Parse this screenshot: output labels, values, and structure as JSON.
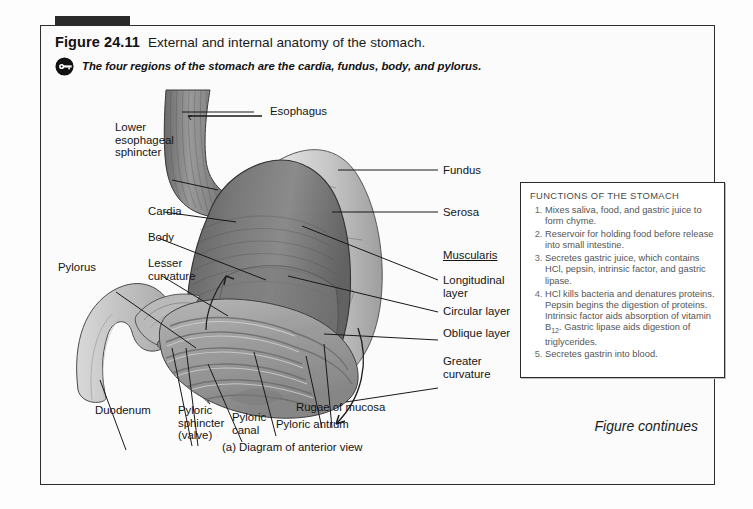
{
  "figure": {
    "number": "Figure 24.11",
    "title": "External and internal anatomy of the stomach.",
    "key_icon": "key-icon",
    "key_point": "The four regions of the stomach are the cardia, fundus, body, and pylorus.",
    "caption": "(a) Diagram of anterior view",
    "continues": "Figure continues"
  },
  "labels": {
    "esophagus": "Esophagus",
    "lower_esophageal_sphincter": "Lower\nesophageal\nsphincter",
    "cardia": "Cardia",
    "body": "Body",
    "lesser_curvature": "Lesser\ncurvature",
    "pylorus": "Pylorus",
    "duodenum": "Duodenum",
    "pyloric_sphincter": "Pyloric\nsphincter\n(valve)",
    "pyloric_canal": "Pyloric\ncanal",
    "pyloric_antrum": "Pyloric antrum",
    "rugae_of_mucosa": "Rugae of mucosa",
    "fundus": "Fundus",
    "serosa": "Serosa",
    "muscularis": "Muscularis",
    "longitudinal_layer": "Longitudinal\nlayer",
    "circular_layer": "Circular layer",
    "oblique_layer": "Oblique layer",
    "greater_curvature": "Greater\ncurvature"
  },
  "functions_box": {
    "heading": "FUNCTIONS OF THE STOMACH",
    "items": [
      "Mixes saliva, food, and gastric juice to form chyme.",
      "Reservoir for holding food before release into small intestine.",
      "Secretes gastric juice, which contains HCl, pepsin, intrinsic factor, and gastric lipase.",
      "HCl kills bacteria and denatures proteins. Pepsin begins the digestion of proteins. Intrinsic factor aids absorption of vitamin B12. Gastric lipase aids digestion of triglycerides.",
      "Secretes gastrin into blood."
    ]
  },
  "colors": {
    "frame": "#2e2e2e",
    "accent": "#2a2a2a",
    "muscle_dark": "#6f6f6f",
    "muscle_mid": "#8c8c8c",
    "serosa_light": "#c9c9c9",
    "mucosa": "#a3a3a3",
    "duodenum": "#c4c4c4",
    "box_text": "#555555"
  }
}
